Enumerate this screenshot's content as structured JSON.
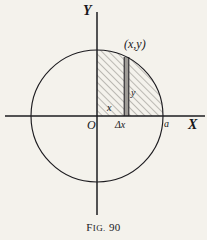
{
  "figure": {
    "caption_prefix": "F",
    "caption_smallcaps": "IG.",
    "caption_number": "90",
    "caption_full": "FIG. 90",
    "background_color": "#f4f2ec",
    "ink_color": "#18171a"
  },
  "axes": {
    "x_label": "X",
    "y_label": "Y",
    "origin_label": "O",
    "x_axis_range_px": [
      5,
      205
    ],
    "y_axis_range_px": [
      12,
      215
    ],
    "origin_px": [
      97,
      116
    ]
  },
  "circle": {
    "center_px": [
      97,
      116
    ],
    "radius_px": 66,
    "stroke_color": "#1d1c20",
    "intercept_label": "a"
  },
  "shaded_region": {
    "hatch_direction": "forward-slash",
    "hatch_color": "#6d6a66",
    "description": "first-quadrant area under circular arc"
  },
  "strip": {
    "label_width": "Δx",
    "label_height": "y",
    "label_abscissa": "x",
    "point_label": "(x,y)",
    "x_left_px": 124,
    "x_right_px": 129,
    "top_px": 57,
    "bottom_px": 116,
    "fill_color": "#9b9894"
  }
}
